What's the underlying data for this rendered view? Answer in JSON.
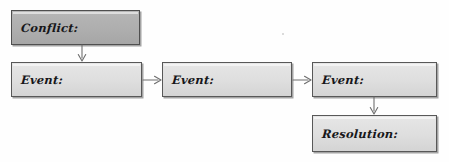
{
  "diagram": {
    "background_color": "#fefefe",
    "box_fill_color": "#dedede",
    "box_fill_color_highlight": "#b0b0b0",
    "box_border_color": "#585858",
    "arrow_color": "#6e6e6e",
    "text_color": "#17171a",
    "nodes": [
      {
        "id": "conflict",
        "label": "Conflict:",
        "style": "highlight",
        "x": 11,
        "y": 10,
        "w": 129,
        "h": 35
      },
      {
        "id": "event-1",
        "label": "Event:",
        "style": "normal",
        "x": 11,
        "y": 62,
        "w": 131,
        "h": 35
      },
      {
        "id": "event-2",
        "label": "Event:",
        "style": "normal",
        "x": 162,
        "y": 62,
        "w": 130,
        "h": 35
      },
      {
        "id": "event-3",
        "label": "Event:",
        "style": "normal",
        "x": 312,
        "y": 62,
        "w": 125,
        "h": 35
      },
      {
        "id": "resolution",
        "label": "Resolution:",
        "style": "normal",
        "x": 312,
        "y": 115,
        "w": 125,
        "h": 37
      }
    ],
    "arrows": [
      {
        "id": "conflict-to-event-1",
        "direction": "down",
        "from": "conflict",
        "to": "event-1",
        "x": 76,
        "y": 45,
        "length": 16
      },
      {
        "id": "event-1-to-event-2",
        "direction": "right",
        "from": "event-1",
        "to": "event-2",
        "x": 143,
        "y": 74,
        "length": 18
      },
      {
        "id": "event-2-to-event-3",
        "direction": "right",
        "from": "event-2",
        "to": "event-3",
        "x": 293,
        "y": 74,
        "length": 18
      },
      {
        "id": "event-3-to-resolution",
        "direction": "down",
        "from": "event-3",
        "to": "resolution",
        "x": 368,
        "y": 97,
        "length": 17
      }
    ],
    "artifacts": [
      {
        "id": "speck-1",
        "x": 282,
        "y": 33,
        "size": 2
      }
    ]
  }
}
